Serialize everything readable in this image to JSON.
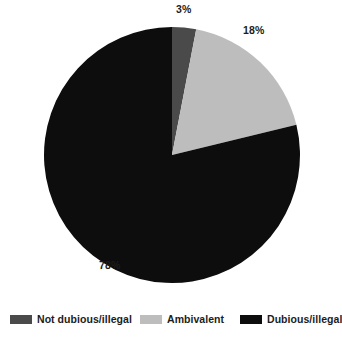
{
  "chart_data": {
    "type": "pie",
    "title": "",
    "categories": [
      "Not dubious/illegal",
      "Ambivalent",
      "Dubious/illegal"
    ],
    "values": [
      3,
      18,
      78
    ],
    "value_labels": [
      "3%",
      "18%",
      "78%"
    ],
    "colors": [
      "#4a4a4a",
      "#bdbdbd",
      "#0d0d0d"
    ],
    "unit": "%",
    "start_angle_deg": 0,
    "direction": "clockwise",
    "legend_position": "bottom",
    "grid": false,
    "xlabel": "",
    "ylabel": ""
  },
  "legend": {
    "items": [
      {
        "label": "Not dubious/illegal",
        "color": "#4a4a4a"
      },
      {
        "label": "Ambivalent",
        "color": "#bdbdbd"
      },
      {
        "label": "Dubious/illegal",
        "color": "#0d0d0d"
      }
    ]
  },
  "geometry": {
    "center_x": 172,
    "center_y": 155,
    "radius": 128
  }
}
